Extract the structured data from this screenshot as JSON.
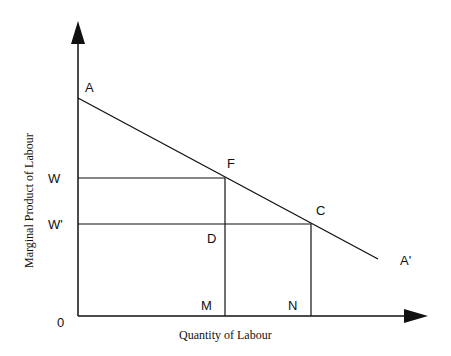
{
  "diagram": {
    "type": "economics-marginal-product-diagram",
    "y_axis_title": "Marginal Product of Labour",
    "x_axis_title": "Quantity of Labour",
    "origin_label": "0",
    "points": {
      "A": "A",
      "A_prime": "A'",
      "F": "F",
      "C": "C",
      "D": "D",
      "M": "M",
      "N": "N",
      "W": "W",
      "W_prime": "W'"
    },
    "colors": {
      "line": "#111111",
      "background": "#ffffff"
    }
  }
}
